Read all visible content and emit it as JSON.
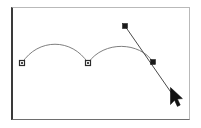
{
  "app": {
    "title": "Vector Path Editor Canvas",
    "canvas_label": "drawing-canvas",
    "background_color": "#ffffff",
    "frame_color": "#3a3a3a"
  },
  "canvas": {
    "frame": {
      "x": 11,
      "y": 7,
      "width": 179,
      "height": 113
    },
    "stroke_color": "#707070",
    "line_color": "#555555",
    "anchor_fill": "#1a1a1a",
    "anchor_size": 4
  },
  "path": {
    "name": "bezier-path",
    "segments": [
      {
        "type": "curve",
        "label": "first-arc",
        "from": [
          22,
          63
        ],
        "control1": [
          38,
          38
        ],
        "control2": [
          72,
          38
        ],
        "to": [
          88,
          63
        ]
      },
      {
        "type": "curve",
        "label": "second-arc",
        "from": [
          88,
          63
        ],
        "control1": [
          104,
          40
        ],
        "control2": [
          140,
          42
        ],
        "to": [
          153,
          62
        ]
      },
      {
        "type": "line",
        "label": "straight-segment",
        "from": [
          125,
          26
        ],
        "to": [
          177,
          101
        ]
      }
    ],
    "anchors": [
      {
        "name": "anchor-point-start",
        "x": 22,
        "y": 63,
        "style": "hollow-square"
      },
      {
        "name": "anchor-point-middle",
        "x": 88,
        "y": 63,
        "style": "hollow-square"
      },
      {
        "name": "control-handle-top",
        "x": 125,
        "y": 26,
        "style": "filled-square"
      },
      {
        "name": "anchor-point-end",
        "x": 153,
        "y": 62,
        "style": "filled-square"
      }
    ]
  },
  "cursor": {
    "name": "mouse-pointer-cursor",
    "x": 170,
    "y": 88,
    "color": "#111111",
    "label": "pointer"
  }
}
